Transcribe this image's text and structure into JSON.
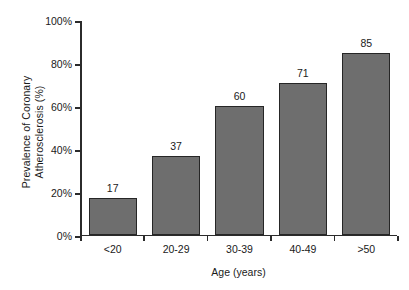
{
  "chart_data": {
    "type": "bar",
    "title": "",
    "categories": [
      "<20",
      "20-29",
      "30-39",
      "40-49",
      ">50"
    ],
    "values": [
      17,
      37,
      60,
      71,
      85
    ],
    "value_labels": [
      "17",
      "37",
      "60",
      "71",
      "85"
    ],
    "xlabel": "Age (years)",
    "ylabel_line1": "Prevalence of Coronary",
    "ylabel_line2": "Atherosclerosis (%)",
    "ylabel": "Prevalence of Coronary Atherosclerosis (%)",
    "ylim": [
      0,
      100
    ],
    "ytick_values": [
      0,
      20,
      40,
      60,
      80,
      100
    ],
    "ytick_labels": [
      "0%",
      "20%",
      "40%",
      "60%",
      "80%",
      "100%"
    ],
    "grid": false,
    "legend": false,
    "legend_position": "none",
    "colors": {
      "bar_fill": "#6e6e6e",
      "bar_border": "#262626",
      "axis": "#2b2b2b",
      "text": "#1a1a1a",
      "background": "#ffffff"
    }
  }
}
